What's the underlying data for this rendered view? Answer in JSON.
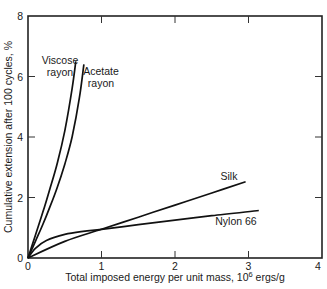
{
  "chart_data": {
    "type": "line",
    "title": "",
    "xlabel": "Total imposed energy per unit mass, 10⁶ ergs/g",
    "xlabel_main": "Total imposed energy per unit mass, 10",
    "xlabel_sup": "6",
    "xlabel_unit": " ergs/g",
    "ylabel": "Cumulative extension after 100 cycles, %",
    "xlim": [
      0,
      4
    ],
    "ylim": [
      0,
      8
    ],
    "xticks": [
      0,
      1,
      2,
      3,
      4
    ],
    "yticks": [
      0,
      2,
      4,
      6,
      8
    ],
    "grid": false,
    "legend": "inline labels",
    "series": [
      {
        "name": "Viscose rayon",
        "label_lines": [
          "Viscose",
          "rayon"
        ],
        "x": [
          0,
          0.1,
          0.2,
          0.3,
          0.4,
          0.5,
          0.6,
          0.65
        ],
        "y": [
          0,
          0.75,
          1.5,
          2.3,
          3.15,
          4.2,
          5.6,
          6.5
        ]
      },
      {
        "name": "Acetate rayon",
        "label_lines": [
          "Acetate",
          "rayon"
        ],
        "x": [
          0,
          0.1,
          0.2,
          0.3,
          0.4,
          0.5,
          0.6,
          0.7,
          0.76
        ],
        "y": [
          0,
          0.55,
          1.1,
          1.7,
          2.35,
          3.1,
          4.0,
          5.3,
          6.4
        ]
      },
      {
        "name": "Silk",
        "label_lines": [
          "Silk"
        ],
        "x": [
          0,
          0.5,
          1.0,
          1.5,
          2.0,
          2.5,
          2.96
        ],
        "y": [
          0,
          0.55,
          0.95,
          1.35,
          1.75,
          2.15,
          2.52
        ]
      },
      {
        "name": "Nylon 66",
        "label_lines": [
          "Nylon 66"
        ],
        "x": [
          0,
          0.1,
          0.25,
          0.5,
          0.75,
          1.0,
          1.5,
          2.0,
          2.5,
          3.14
        ],
        "y": [
          0,
          0.32,
          0.58,
          0.78,
          0.88,
          0.95,
          1.1,
          1.25,
          1.4,
          1.57
        ]
      }
    ]
  }
}
